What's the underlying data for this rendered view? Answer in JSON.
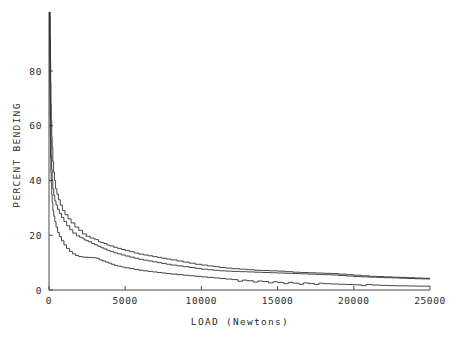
{
  "chart_data": {
    "type": "line",
    "title": "",
    "xlabel": "LOAD  (Newtons)",
    "ylabel": "PERCENT BENDING",
    "xlim": [
      0,
      25000
    ],
    "ylim": [
      0,
      105
    ],
    "grid": false,
    "legend": "none",
    "xticks": [
      0,
      5000,
      10000,
      15000,
      20000,
      25000
    ],
    "xtick_labels": [
      "0",
      "5000",
      "10000",
      "15000",
      "20000",
      "25000"
    ],
    "yticks": [
      0,
      20,
      40,
      60,
      80
    ],
    "ytick_labels": [
      "0",
      "20",
      "40",
      "60",
      "80"
    ],
    "series": [
      {
        "name": "curve-1",
        "points": [
          [
            60,
            105
          ],
          [
            70,
            100
          ],
          [
            80,
            92
          ],
          [
            95,
            84
          ],
          [
            110,
            76
          ],
          [
            130,
            68
          ],
          [
            150,
            62
          ],
          [
            180,
            56
          ],
          [
            210,
            52
          ],
          [
            250,
            47
          ],
          [
            300,
            43
          ],
          [
            360,
            40
          ],
          [
            430,
            37
          ],
          [
            520,
            35
          ],
          [
            620,
            33
          ],
          [
            740,
            31
          ],
          [
            880,
            29
          ],
          [
            1050,
            27.5
          ],
          [
            1250,
            26
          ],
          [
            1450,
            24.5
          ],
          [
            1700,
            23
          ],
          [
            1950,
            21.8
          ],
          [
            2200,
            20.5
          ],
          [
            2450,
            19.6
          ],
          [
            2700,
            19.0
          ],
          [
            2950,
            18.6
          ],
          [
            3100,
            18.4
          ],
          [
            3250,
            17.6
          ],
          [
            3400,
            17.3
          ],
          [
            3600,
            17.0
          ],
          [
            3800,
            16.4
          ],
          [
            4000,
            16.1
          ],
          [
            4250,
            15.6
          ],
          [
            4500,
            15.2
          ],
          [
            4750,
            14.8
          ],
          [
            5000,
            14.4
          ],
          [
            5300,
            14.0
          ],
          [
            5600,
            13.5
          ],
          [
            5900,
            13.1
          ],
          [
            6200,
            12.8
          ],
          [
            6500,
            12.5
          ],
          [
            6800,
            12.2
          ],
          [
            7100,
            11.9
          ],
          [
            7400,
            11.6
          ],
          [
            7700,
            11.3
          ],
          [
            8000,
            11.0
          ],
          [
            8400,
            10.6
          ],
          [
            8800,
            10.2
          ],
          [
            9200,
            9.8
          ],
          [
            9600,
            9.4
          ],
          [
            10000,
            9.1
          ],
          [
            10400,
            8.8
          ],
          [
            10800,
            8.5
          ],
          [
            11200,
            8.2
          ],
          [
            11600,
            8.0
          ],
          [
            12000,
            7.8
          ],
          [
            12500,
            7.6
          ],
          [
            13000,
            7.4
          ],
          [
            13500,
            7.2
          ],
          [
            14000,
            7.1
          ],
          [
            14500,
            7.0
          ],
          [
            15000,
            6.9
          ],
          [
            15500,
            6.7
          ],
          [
            16000,
            6.5
          ],
          [
            16500,
            6.4
          ],
          [
            17000,
            6.3
          ],
          [
            17500,
            6.2
          ],
          [
            18000,
            6.1
          ],
          [
            18500,
            6.0
          ],
          [
            19000,
            5.8
          ],
          [
            19500,
            5.6
          ],
          [
            20000,
            5.4
          ],
          [
            20500,
            5.2
          ],
          [
            21000,
            5.0
          ],
          [
            21500,
            4.9
          ],
          [
            22000,
            4.8
          ],
          [
            22500,
            4.7
          ],
          [
            23000,
            4.6
          ],
          [
            23500,
            4.5
          ],
          [
            24000,
            4.4
          ],
          [
            24500,
            4.3
          ],
          [
            25000,
            4.2
          ]
        ]
      },
      {
        "name": "curve-2",
        "points": [
          [
            40,
            105
          ],
          [
            50,
            98
          ],
          [
            60,
            88
          ],
          [
            72,
            78
          ],
          [
            85,
            70
          ],
          [
            100,
            62
          ],
          [
            120,
            55
          ],
          [
            145,
            49
          ],
          [
            175,
            44
          ],
          [
            210,
            40
          ],
          [
            255,
            37
          ],
          [
            310,
            34.5
          ],
          [
            380,
            32.5
          ],
          [
            460,
            31
          ],
          [
            560,
            29.5
          ],
          [
            680,
            28
          ],
          [
            820,
            26.5
          ],
          [
            980,
            25
          ],
          [
            1160,
            23.5
          ],
          [
            1360,
            22
          ],
          [
            1560,
            20.8
          ],
          [
            1800,
            19.8
          ],
          [
            2000,
            19.3
          ],
          [
            2150,
            19.0
          ],
          [
            2300,
            18.3
          ],
          [
            2450,
            18.0
          ],
          [
            2600,
            17.6
          ],
          [
            2800,
            17.0
          ],
          [
            3000,
            16.5
          ],
          [
            3200,
            16.0
          ],
          [
            3400,
            15.4
          ],
          [
            3600,
            15.0
          ],
          [
            3800,
            14.5
          ],
          [
            4000,
            14.1
          ],
          [
            4250,
            13.6
          ],
          [
            4500,
            13.2
          ],
          [
            4750,
            12.8
          ],
          [
            5000,
            12.4
          ],
          [
            5300,
            12.0
          ],
          [
            5600,
            11.6
          ],
          [
            5900,
            11.2
          ],
          [
            6200,
            10.9
          ],
          [
            6500,
            10.6
          ],
          [
            6800,
            10.3
          ],
          [
            7100,
            10.0
          ],
          [
            7400,
            9.7
          ],
          [
            7700,
            9.4
          ],
          [
            8000,
            9.1
          ],
          [
            8400,
            8.8
          ],
          [
            8800,
            8.5
          ],
          [
            9200,
            8.2
          ],
          [
            9600,
            7.9
          ],
          [
            10000,
            7.6
          ],
          [
            10400,
            7.4
          ],
          [
            10800,
            7.2
          ],
          [
            11200,
            7.0
          ],
          [
            11600,
            6.9
          ],
          [
            12000,
            6.8
          ],
          [
            12500,
            6.7
          ],
          [
            13000,
            6.6
          ],
          [
            13500,
            6.5
          ],
          [
            14000,
            6.4
          ],
          [
            14500,
            6.3
          ],
          [
            15000,
            6.2
          ],
          [
            15500,
            6.1
          ],
          [
            16000,
            6.0
          ],
          [
            16500,
            5.9
          ],
          [
            17000,
            5.8
          ],
          [
            17500,
            5.7
          ],
          [
            18000,
            5.6
          ],
          [
            18500,
            5.5
          ],
          [
            19000,
            5.3
          ],
          [
            19500,
            5.1
          ],
          [
            20000,
            4.9
          ],
          [
            20500,
            4.8
          ],
          [
            21000,
            4.7
          ],
          [
            21500,
            4.6
          ],
          [
            22000,
            4.5
          ],
          [
            22500,
            4.4
          ],
          [
            23000,
            4.3
          ],
          [
            23500,
            4.2
          ],
          [
            24000,
            4.1
          ],
          [
            24500,
            4.05
          ],
          [
            25000,
            4.0
          ]
        ]
      },
      {
        "name": "curve-3",
        "points": [
          [
            30,
            105
          ],
          [
            38,
            95
          ],
          [
            46,
            85
          ],
          [
            56,
            74
          ],
          [
            68,
            64
          ],
          [
            82,
            56
          ],
          [
            100,
            48
          ],
          [
            120,
            43
          ],
          [
            145,
            39
          ],
          [
            175,
            35
          ],
          [
            210,
            32
          ],
          [
            255,
            29
          ],
          [
            310,
            27
          ],
          [
            380,
            25
          ],
          [
            460,
            23
          ],
          [
            560,
            21
          ],
          [
            680,
            19.5
          ],
          [
            820,
            18
          ],
          [
            980,
            16.5
          ],
          [
            1150,
            15.2
          ],
          [
            1350,
            14.0
          ],
          [
            1550,
            13.2
          ],
          [
            1750,
            12.6
          ],
          [
            1950,
            12.2
          ],
          [
            2200,
            12.0
          ],
          [
            2500,
            11.9
          ],
          [
            2800,
            11.8
          ],
          [
            3100,
            11.6
          ],
          [
            3300,
            11.0
          ],
          [
            3500,
            10.6
          ],
          [
            3700,
            10.2
          ],
          [
            3900,
            9.8
          ],
          [
            4100,
            9.4
          ],
          [
            4300,
            9.0
          ],
          [
            4500,
            8.7
          ],
          [
            4750,
            8.4
          ],
          [
            5000,
            8.1
          ],
          [
            5300,
            7.8
          ],
          [
            5600,
            7.5
          ],
          [
            5900,
            7.2
          ],
          [
            6200,
            7.0
          ],
          [
            6500,
            6.8
          ],
          [
            6800,
            6.6
          ],
          [
            7100,
            6.4
          ],
          [
            7400,
            6.2
          ],
          [
            7700,
            6.0
          ],
          [
            8000,
            5.8
          ],
          [
            8400,
            5.6
          ],
          [
            8800,
            5.4
          ],
          [
            9200,
            5.2
          ],
          [
            9600,
            5.0
          ],
          [
            10000,
            4.8
          ],
          [
            10400,
            4.6
          ],
          [
            10800,
            4.4
          ],
          [
            11200,
            4.2
          ],
          [
            11600,
            4.0
          ],
          [
            12000,
            3.8
          ],
          [
            12400,
            3.2
          ],
          [
            12700,
            3.6
          ],
          [
            13000,
            3.4
          ],
          [
            13400,
            2.9
          ],
          [
            13700,
            3.3
          ],
          [
            14000,
            3.1
          ],
          [
            14400,
            2.6
          ],
          [
            14700,
            3.0
          ],
          [
            15000,
            2.8
          ],
          [
            15400,
            2.3
          ],
          [
            15700,
            2.8
          ],
          [
            16000,
            2.5
          ],
          [
            16400,
            2.1
          ],
          [
            16700,
            2.6
          ],
          [
            17000,
            2.4
          ],
          [
            17400,
            2.0
          ],
          [
            17700,
            2.5
          ],
          [
            18000,
            2.3
          ],
          [
            18500,
            2.2
          ],
          [
            19000,
            2.1
          ],
          [
            19500,
            2.0
          ],
          [
            20000,
            1.9
          ],
          [
            20500,
            1.6
          ],
          [
            20800,
            2.0
          ],
          [
            21200,
            1.8
          ],
          [
            21700,
            1.7
          ],
          [
            22200,
            1.6
          ],
          [
            22700,
            1.55
          ],
          [
            23200,
            1.5
          ],
          [
            23700,
            1.45
          ],
          [
            24200,
            1.4
          ],
          [
            25000,
            1.35
          ]
        ]
      }
    ]
  },
  "axes": {
    "x_title": "LOAD  (Newtons)",
    "y_title": "PERCENT BENDING"
  }
}
